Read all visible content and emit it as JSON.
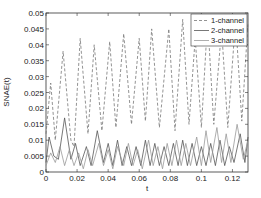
{
  "chart_data": {
    "type": "line",
    "title": "",
    "xlabel": "t",
    "ylabel": "SNAE(t)",
    "xlim": [
      0,
      0.13
    ],
    "ylim": [
      0,
      0.05
    ],
    "x_ticks": [
      "0",
      "0.02",
      "0.04",
      "0.06",
      "0.08",
      "0.1",
      "0.12"
    ],
    "y_ticks": [
      "0",
      "0.005",
      "0.01",
      "0.015",
      "0.02",
      "0.025",
      "0.03",
      "0.035",
      "0.04",
      "0.045",
      "0.05"
    ],
    "grid": false,
    "legend_position": "upper right",
    "series": [
      {
        "name": "1-channel",
        "style": "dashed",
        "color": "#777777",
        "points": [
          [
            0.0,
            0.012
          ],
          [
            0.003,
            0.028
          ],
          [
            0.006,
            0.01
          ],
          [
            0.011,
            0.038
          ],
          [
            0.016,
            0.01
          ],
          [
            0.018,
            0.008
          ],
          [
            0.022,
            0.042
          ],
          [
            0.027,
            0.012
          ],
          [
            0.031,
            0.04
          ],
          [
            0.036,
            0.013
          ],
          [
            0.041,
            0.041
          ],
          [
            0.045,
            0.014
          ],
          [
            0.05,
            0.0435
          ],
          [
            0.055,
            0.015
          ],
          [
            0.06,
            0.042
          ],
          [
            0.064,
            0.016
          ],
          [
            0.068,
            0.045
          ],
          [
            0.073,
            0.014
          ],
          [
            0.079,
            0.045
          ],
          [
            0.083,
            0.013
          ],
          [
            0.088,
            0.048
          ],
          [
            0.092,
            0.015
          ],
          [
            0.096,
            0.042
          ],
          [
            0.1,
            0.014
          ],
          [
            0.104,
            0.048
          ],
          [
            0.108,
            0.015
          ],
          [
            0.113,
            0.045
          ],
          [
            0.117,
            0.014
          ],
          [
            0.122,
            0.048
          ],
          [
            0.126,
            0.016
          ],
          [
            0.13,
            0.047
          ]
        ]
      },
      {
        "name": "2-channel",
        "style": "solid",
        "color": "#555555",
        "points": [
          [
            0.0,
            0.003
          ],
          [
            0.002,
            0.011
          ],
          [
            0.005,
            0.005
          ],
          [
            0.008,
            0.004
          ],
          [
            0.012,
            0.017
          ],
          [
            0.016,
            0.004
          ],
          [
            0.019,
            0.009
          ],
          [
            0.022,
            0.002
          ],
          [
            0.026,
            0.008
          ],
          [
            0.029,
            0.002
          ],
          [
            0.033,
            0.013
          ],
          [
            0.037,
            0.003
          ],
          [
            0.04,
            0.009
          ],
          [
            0.043,
            0.002
          ],
          [
            0.046,
            0.01
          ],
          [
            0.049,
            0.002
          ],
          [
            0.052,
            0.008
          ],
          [
            0.055,
            0.002
          ],
          [
            0.058,
            0.008
          ],
          [
            0.061,
            0.002
          ],
          [
            0.064,
            0.01
          ],
          [
            0.067,
            0.002
          ],
          [
            0.07,
            0.009
          ],
          [
            0.073,
            0.002
          ],
          [
            0.076,
            0.008
          ],
          [
            0.079,
            0.002
          ],
          [
            0.082,
            0.009
          ],
          [
            0.085,
            0.002
          ],
          [
            0.088,
            0.01
          ],
          [
            0.091,
            0.002
          ],
          [
            0.094,
            0.009
          ],
          [
            0.097,
            0.002
          ],
          [
            0.1,
            0.008
          ],
          [
            0.103,
            0.002
          ],
          [
            0.106,
            0.009
          ],
          [
            0.109,
            0.002
          ],
          [
            0.112,
            0.01
          ],
          [
            0.115,
            0.002
          ],
          [
            0.118,
            0.008
          ],
          [
            0.121,
            0.003
          ],
          [
            0.125,
            0.012
          ],
          [
            0.128,
            0.003
          ],
          [
            0.13,
            0.011
          ]
        ]
      },
      {
        "name": "3-channel",
        "style": "solid",
        "color": "#999999",
        "points": [
          [
            0.0,
            0.002
          ],
          [
            0.003,
            0.006
          ],
          [
            0.006,
            0.003
          ],
          [
            0.009,
            0.008
          ],
          [
            0.012,
            0.002
          ],
          [
            0.015,
            0.007
          ],
          [
            0.018,
            0.002
          ],
          [
            0.021,
            0.006
          ],
          [
            0.024,
            0.001
          ],
          [
            0.027,
            0.007
          ],
          [
            0.03,
            0.002
          ],
          [
            0.034,
            0.009
          ],
          [
            0.037,
            0.002
          ],
          [
            0.04,
            0.007
          ],
          [
            0.043,
            0.001
          ],
          [
            0.046,
            0.008
          ],
          [
            0.05,
            0.002
          ],
          [
            0.053,
            0.009
          ],
          [
            0.056,
            0.002
          ],
          [
            0.059,
            0.007
          ],
          [
            0.062,
            0.001
          ],
          [
            0.066,
            0.01
          ],
          [
            0.069,
            0.002
          ],
          [
            0.072,
            0.008
          ],
          [
            0.075,
            0.001
          ],
          [
            0.078,
            0.009
          ],
          [
            0.081,
            0.002
          ],
          [
            0.084,
            0.01
          ],
          [
            0.087,
            0.002
          ],
          [
            0.09,
            0.009
          ],
          [
            0.093,
            0.002
          ],
          [
            0.097,
            0.011
          ],
          [
            0.1,
            0.002
          ],
          [
            0.103,
            0.013
          ],
          [
            0.106,
            0.003
          ],
          [
            0.11,
            0.014
          ],
          [
            0.113,
            0.003
          ],
          [
            0.116,
            0.012
          ],
          [
            0.119,
            0.003
          ],
          [
            0.123,
            0.015
          ],
          [
            0.127,
            0.004
          ],
          [
            0.13,
            0.01
          ]
        ]
      }
    ]
  },
  "legend": {
    "items": [
      "1-channel",
      "2-channel",
      "3-channel"
    ]
  }
}
